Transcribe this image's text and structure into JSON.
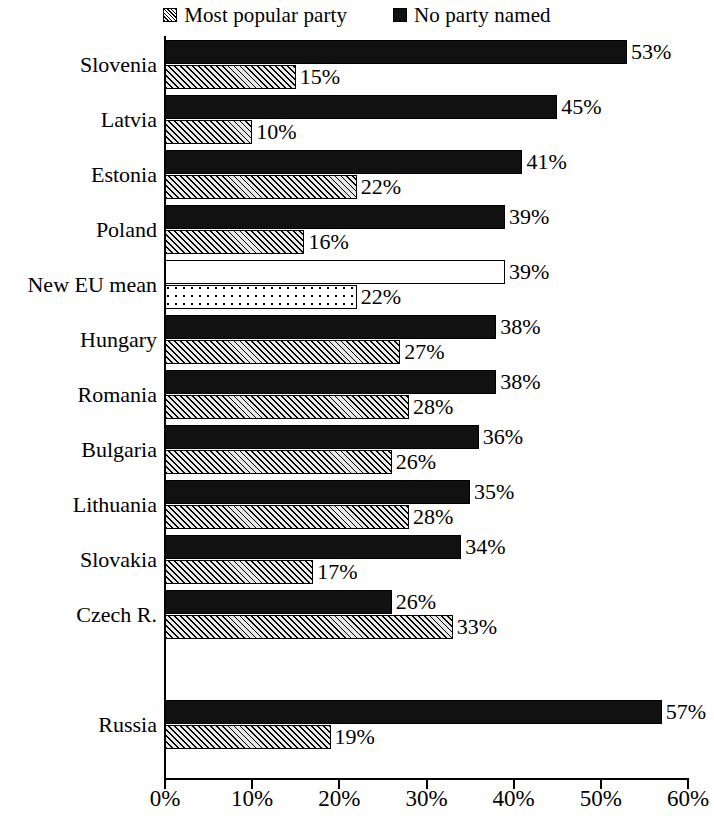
{
  "legend": {
    "entries": [
      {
        "label": "Most popular party",
        "swatch": "hatched-square-icon",
        "color": "#000000"
      },
      {
        "label": "No party named",
        "swatch": "solid-square-icon",
        "color": "#111111"
      }
    ]
  },
  "axis": {
    "x_tick_labels": [
      "0%",
      "10%",
      "20%",
      "30%",
      "40%",
      "50%",
      "60%"
    ],
    "x_tick_values": [
      0,
      10,
      20,
      30,
      40,
      50,
      60
    ]
  },
  "chart_data": {
    "type": "bar",
    "orientation": "horizontal",
    "title": "",
    "subtitle": "",
    "xlabel": "",
    "ylabel": "",
    "xlim": [
      0,
      60
    ],
    "grid": false,
    "legend_position": "top-center",
    "categories": [
      "Slovenia",
      "Latvia",
      "Estonia",
      "Poland",
      "New EU mean",
      "Hungary",
      "Romania",
      "Bulgaria",
      "Lithuania",
      "Slovakia",
      "Czech R.",
      "Russia"
    ],
    "series": [
      {
        "name": "No party named",
        "values": [
          53,
          45,
          41,
          39,
          39,
          38,
          38,
          36,
          35,
          34,
          26,
          57
        ],
        "labels": [
          "53%",
          "45%",
          "41%",
          "39%",
          "39%",
          "38%",
          "38%",
          "36%",
          "35%",
          "34%",
          "26%",
          "57%"
        ]
      },
      {
        "name": "Most popular party",
        "values": [
          15,
          10,
          22,
          16,
          22,
          27,
          28,
          26,
          28,
          17,
          33,
          19
        ],
        "labels": [
          "15%",
          "10%",
          "22%",
          "16%",
          "22%",
          "27%",
          "28%",
          "26%",
          "28%",
          "17%",
          "33%",
          "19%"
        ]
      }
    ],
    "highlighted_category": "New EU mean",
    "separated_category": "Russia"
  }
}
